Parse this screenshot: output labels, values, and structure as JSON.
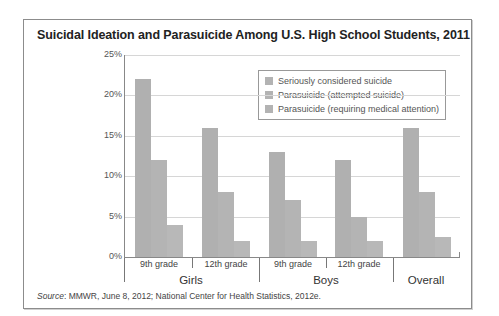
{
  "chart_data": {
    "type": "bar",
    "title": "Suicidal Ideation and Parasuicide Among U.S. High School Students, 2011",
    "xlabel": "",
    "ylabel": "",
    "ylim": [
      0,
      25
    ],
    "yticks": [
      "0%",
      "5%",
      "10%",
      "15%",
      "20%",
      "25%"
    ],
    "grid": true,
    "legend_position": "upper right (inside plot)",
    "categories": [
      "Girls 9th grade",
      "Girls 12th grade",
      "Boys 9th grade",
      "Boys 12th grade",
      "Overall"
    ],
    "category_labels": [
      "9th grade",
      "12th grade",
      "9th grade",
      "12th grade",
      ""
    ],
    "group_labels": [
      "Girls",
      "Boys",
      "Overall"
    ],
    "series": [
      {
        "name": "Seriously considered suicide",
        "values": [
          22,
          16,
          13,
          12,
          16
        ]
      },
      {
        "name": "Parasuicide (attempted suicide)",
        "values": [
          12,
          8,
          7,
          5,
          8
        ]
      },
      {
        "name": "Parasuicide (requiring medical attention)",
        "values": [
          4,
          2,
          2,
          2,
          2.5
        ]
      }
    ],
    "source_label": "Source",
    "source_text": ": MMWR, June 8, 2012; National Center for Health Statistics, 2012e."
  }
}
